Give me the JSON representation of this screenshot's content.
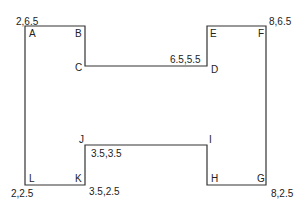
{
  "diagram": {
    "shape": "H-shaped polygon",
    "stroke_color": "#333333",
    "vertices": [
      {
        "label": "A",
        "coord": "2,6.5"
      },
      {
        "label": "B",
        "coord": null
      },
      {
        "label": "C",
        "coord": null
      },
      {
        "label": "D",
        "coord": "6.5,5.5"
      },
      {
        "label": "E",
        "coord": null
      },
      {
        "label": "F",
        "coord": "8,6.5"
      },
      {
        "label": "G",
        "coord": "8,2.5"
      },
      {
        "label": "H",
        "coord": null
      },
      {
        "label": "I",
        "coord": null
      },
      {
        "label": "J",
        "coord": "3.5,3.5"
      },
      {
        "label": "K",
        "coord": "3.5,2.5"
      },
      {
        "label": "L",
        "coord": "2,2.5"
      }
    ]
  }
}
